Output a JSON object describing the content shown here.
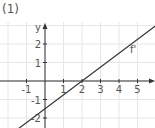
{
  "figure": {
    "label": "(1)"
  },
  "chart_data": {
    "type": "line",
    "title": "",
    "xlabel": "x",
    "ylabel": "y",
    "xlim": [
      -2.4,
      6
    ],
    "ylim": [
      -2.6,
      3.3
    ],
    "grid": true,
    "x_ticks": [
      -1,
      1,
      2,
      3,
      4,
      5
    ],
    "y_ticks": [
      -2,
      -1,
      1,
      2
    ],
    "series": [
      {
        "name": "f'",
        "equation": "y = 0.75x - 1.5",
        "x": [
          -1.5,
          6
        ],
        "values": [
          -2.625,
          3.0
        ]
      }
    ],
    "annotations": [
      {
        "text": "f'",
        "x": 4.6,
        "y": 1.5
      }
    ]
  },
  "colors": {
    "grid": "#e6e6e6",
    "axis": "#333333",
    "line": "#333333",
    "text": "#555555"
  }
}
